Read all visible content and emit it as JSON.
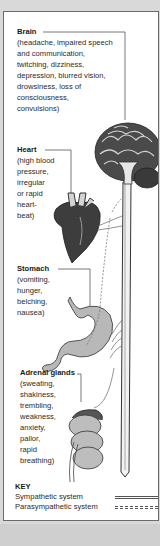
{
  "organs": [
    {
      "name": "Brain",
      "symptoms": "(headache, impaired speech\nand communication,\ntwitching, dizziness,\ndepression, blurred vision,\ndrowsiness, loss of\nconsciousness,\nconvulsions)"
    },
    {
      "name": "Heart",
      "symptoms": "(high blood\npressure,\nirregular\nor rapid\nheart-\nbeat)"
    },
    {
      "name": "Stomach",
      "symptoms": "(vomiting,\nhunger,\nbelching,\nnausea)"
    },
    {
      "name": "Adrenal glands",
      "symptoms": "(sweating,\nshakiness,\ntrembling,\nweakness,\nanxiety,\npallor,\nrapid\nbreathing)"
    }
  ],
  "key": {
    "title": "KEY",
    "items": [
      {
        "label": "Sympathetic system",
        "style": "double-solid"
      },
      {
        "label": "Parasympathetic system",
        "style": "double-dashed"
      }
    ]
  },
  "colors": {
    "background": "#d9d9d9",
    "panel": "#ffffff",
    "border": "#6a6a6a",
    "text": "#2a2a2a",
    "organ_dark": "#3a3a3a",
    "organ_mid": "#8a8a8a"
  }
}
